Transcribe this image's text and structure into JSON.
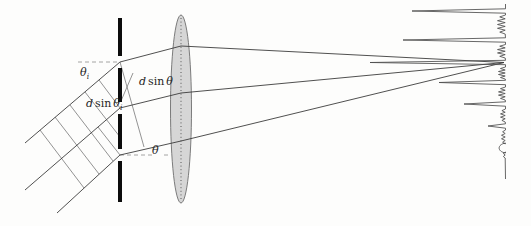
{
  "figure": {
    "type": "diffraction-grating-with-lens-and-spectrum",
    "background": "#fdfdfc",
    "ink": "#3c3c3c",
    "grating_color": "#0c0c0c",
    "lens_fill": "#d6d6d6",
    "lens_stroke": "#6e6e6e",
    "spectrum_color": "#4d4d4d"
  },
  "labels": [
    {
      "name": "label-theta-i",
      "x": 80,
      "y": 76,
      "d": "",
      "sin": "",
      "main": "θ",
      "sub": "i"
    },
    {
      "name": "label-d-sin-theta",
      "x": 139,
      "y": 85,
      "d": "d",
      "sin": "sin",
      "main": "θ",
      "sub": ""
    },
    {
      "name": "label-d-sin-theta-i",
      "x": 86,
      "y": 107,
      "d": "d",
      "sin": "sin",
      "main": "θ",
      "sub": "i"
    },
    {
      "name": "label-theta",
      "x": 152,
      "y": 154,
      "d": "",
      "sin": "",
      "main": "θ",
      "sub": ""
    }
  ],
  "incident_rays": [
    {
      "name": "incident-ray-top",
      "pts": [
        [
          25,
          143
        ],
        [
          120,
          62
        ]
      ]
    },
    {
      "name": "incident-ray-middle",
      "pts": [
        [
          25,
          190
        ],
        [
          120,
          108
        ]
      ]
    },
    {
      "name": "incident-ray-bottom",
      "pts": [
        [
          57,
          213
        ],
        [
          120,
          155
        ]
      ]
    }
  ],
  "wavefronts": [
    {
      "name": "wavefront-line",
      "pts": [
        [
          40,
          130
        ],
        [
          84,
          188
        ]
      ]
    },
    {
      "name": "wavefront-line",
      "pts": [
        [
          55,
          117
        ],
        [
          99,
          174
        ]
      ]
    },
    {
      "name": "wavefront-line",
      "pts": [
        [
          70,
          105
        ],
        [
          113,
          161
        ]
      ]
    },
    {
      "name": "wavefront-line",
      "pts": [
        [
          85,
          92
        ],
        [
          120,
          137
        ]
      ]
    },
    {
      "name": "wavefront-slit-top",
      "pts": [
        [
          99,
          80
        ],
        [
          120,
          108
        ]
      ]
    },
    {
      "name": "wavefront-slit-bottom",
      "pts": [
        [
          98,
          127
        ],
        [
          120,
          155
        ]
      ]
    }
  ],
  "construction_lines": [
    {
      "name": "path-difference-line",
      "pts": [
        [
          120,
          62
        ],
        [
          144,
          147
        ]
      ]
    },
    {
      "name": "label-leader-line",
      "pts": [
        [
          133,
          73
        ],
        [
          121,
          101
        ]
      ]
    }
  ],
  "dashed_lines": [
    {
      "name": "incident-angle-reference",
      "pts": [
        [
          78,
          62
        ],
        [
          120,
          62
        ]
      ]
    },
    {
      "name": "diffraction-angle-reference",
      "pts": [
        [
          120,
          155
        ],
        [
          152,
          155
        ]
      ]
    },
    {
      "name": "diffraction-angle-reference",
      "pts": [
        [
          164,
          155
        ],
        [
          171,
          155
        ]
      ]
    }
  ],
  "grating": {
    "x": 118,
    "width": 4,
    "segments": [
      [
        18,
        56
      ],
      [
        68,
        102
      ],
      [
        114,
        149
      ],
      [
        161,
        202
      ]
    ]
  },
  "diffracted_rays": [
    {
      "name": "diffracted-ray-top",
      "pts": [
        [
          120,
          62
        ],
        [
          181,
          46
        ],
        [
          504,
          62.5
        ]
      ]
    },
    {
      "name": "diffracted-ray-middle",
      "pts": [
        [
          120,
          108
        ],
        [
          181,
          93
        ],
        [
          504,
          62.5
        ]
      ]
    },
    {
      "name": "diffracted-ray-bottom",
      "pts": [
        [
          120,
          155
        ],
        [
          181,
          141
        ],
        [
          504,
          62.5
        ]
      ]
    }
  ],
  "lens": {
    "cx": 181,
    "cy": 109,
    "rx": 10.5,
    "ry": 94
  },
  "spectrum": {
    "axis_x": 505.5,
    "axis_top": 4,
    "axis_bottom": 179,
    "peak_half_width": 2.2,
    "peaks": [
      {
        "y": 11,
        "tip": 412
      },
      {
        "y": 40,
        "tip": 403
      },
      {
        "y": 62.5,
        "tip": 370
      },
      {
        "y": 82.5,
        "tip": 439
      },
      {
        "y": 104,
        "tip": 464
      },
      {
        "y": 126,
        "tip": 488
      },
      {
        "y": 148,
        "tip": 497,
        "rounded": true
      }
    ],
    "wiggles": [
      {
        "from": 15,
        "to": 34,
        "count": 5,
        "amp": 8
      },
      {
        "from": 44.5,
        "to": 58,
        "count": 4,
        "amp": 8
      },
      {
        "from": 67,
        "to": 79,
        "count": 4,
        "amp": 7
      },
      {
        "from": 87,
        "to": 100,
        "count": 4,
        "amp": 7
      },
      {
        "from": 109,
        "to": 122,
        "count": 4,
        "amp": 5
      },
      {
        "from": 130,
        "to": 144,
        "count": 4,
        "amp": 4
      },
      {
        "from": 152,
        "to": 158,
        "count": 2,
        "amp": 3
      }
    ]
  }
}
